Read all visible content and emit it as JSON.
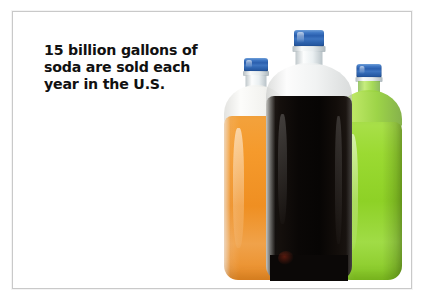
{
  "poster": {
    "headline": "15 billion gallons of\nsoda are sold each\nyear in the U.S.",
    "headline_line_1": "15 billion gallons of",
    "headline_line_2": "soda are sold each",
    "headline_line_3": "year in the U.S.",
    "background_color": "#ffffff",
    "frame_color": "#c9c9c9",
    "text_color": "#111111"
  },
  "photo": {
    "subject": "three 2-liter plastic soda bottles",
    "bottle_count": 3,
    "bottles": [
      {
        "name": "orange-soda-bottle",
        "position": "left",
        "depth": "behind",
        "liquid_color": "#f0941f",
        "cap_color": "#2a5fae",
        "cap_name": "blue-bottle-cap"
      },
      {
        "name": "cola-bottle",
        "position": "center",
        "depth": "front",
        "liquid_color": "#0a0706",
        "cap_color": "#2a5fae",
        "cap_name": "blue-bottle-cap"
      },
      {
        "name": "green-soda-bottle",
        "position": "right",
        "depth": "behind",
        "liquid_color": "#8ed126",
        "cap_color": "#2a5fae",
        "cap_name": "blue-bottle-cap"
      }
    ]
  }
}
